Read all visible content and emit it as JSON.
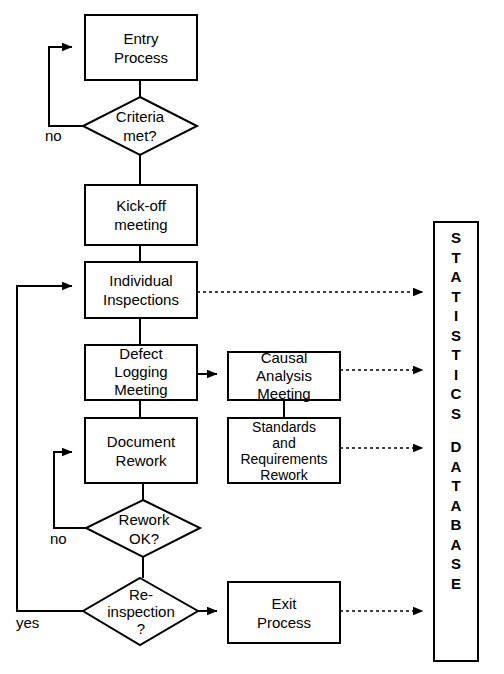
{
  "diagram": {
    "stroke_color": "#000000",
    "fill_color": "#ffffff",
    "nodes": [
      {
        "id": "entry",
        "shape": "process",
        "label": "Entry\nProcess",
        "x": 85,
        "y": 15,
        "w": 112,
        "h": 65
      },
      {
        "id": "criteria",
        "shape": "decision",
        "label": "Criteria\nmet?",
        "x": 83,
        "y": 97,
        "w": 114,
        "h": 58
      },
      {
        "id": "kickoff",
        "shape": "process",
        "label": "Kick-off\nmeeting",
        "x": 85,
        "y": 185,
        "w": 112,
        "h": 60
      },
      {
        "id": "individual",
        "shape": "process",
        "label": "Individual\nInspections",
        "x": 85,
        "y": 262,
        "w": 112,
        "h": 56
      },
      {
        "id": "defect",
        "shape": "process",
        "label": "Defect\nLogging\nMeeting",
        "x": 85,
        "y": 345,
        "w": 112,
        "h": 55
      },
      {
        "id": "causal",
        "shape": "process",
        "label": "Causal\nAnalysis\nMeeting",
        "x": 228,
        "y": 352,
        "w": 112,
        "h": 48
      },
      {
        "id": "document",
        "shape": "process",
        "label": "Document\nRework",
        "x": 85,
        "y": 418,
        "w": 112,
        "h": 65
      },
      {
        "id": "standards",
        "shape": "process",
        "label": "Standards\nand\nRequirements\nRework",
        "x": 228,
        "y": 418,
        "w": 112,
        "h": 65
      },
      {
        "id": "reworkok",
        "shape": "decision",
        "label": "Rework\nOK?",
        "x": 86,
        "y": 500,
        "w": 114,
        "h": 57
      },
      {
        "id": "reinspect",
        "shape": "decision",
        "label": "Re-\ninspection\n?",
        "x": 83,
        "y": 578,
        "w": 115,
        "h": 67
      },
      {
        "id": "exit",
        "shape": "process",
        "label": "Exit\nProcess",
        "x": 228,
        "y": 582,
        "w": 112,
        "h": 61
      },
      {
        "id": "database",
        "shape": "process",
        "label": "STATISTICS DATABASE",
        "x": 434,
        "y": 222,
        "w": 44,
        "h": 439
      }
    ],
    "database_letters_line1": [
      "S",
      "T",
      "A",
      "T",
      "I",
      "S",
      "T",
      "I",
      "C",
      "S"
    ],
    "database_letters_line2": [
      "D",
      "A",
      "T",
      "A",
      "B",
      "A",
      "S",
      "E"
    ],
    "edge_labels": [
      {
        "id": "criteria-no",
        "text": "no",
        "x": 45,
        "y": 128
      },
      {
        "id": "reworkok-no",
        "text": "no",
        "x": 50,
        "y": 532
      },
      {
        "id": "reinspect-yes",
        "text": "yes",
        "x": 16,
        "y": 617
      }
    ],
    "connections": [
      {
        "from": "entry",
        "to": "criteria",
        "style": "solid",
        "arrow": false
      },
      {
        "from": "criteria",
        "to": "entry",
        "style": "solid",
        "arrow": true,
        "label": "no"
      },
      {
        "from": "criteria",
        "to": "kickoff",
        "style": "solid",
        "arrow": false
      },
      {
        "from": "kickoff",
        "to": "individual",
        "style": "solid",
        "arrow": false
      },
      {
        "from": "individual",
        "to": "defect",
        "style": "solid",
        "arrow": false
      },
      {
        "from": "individual",
        "to": "database",
        "style": "dotted",
        "arrow": true
      },
      {
        "from": "defect",
        "to": "causal",
        "style": "solid",
        "arrow": true
      },
      {
        "from": "defect",
        "to": "document",
        "style": "solid",
        "arrow": false
      },
      {
        "from": "causal",
        "to": "database",
        "style": "dotted",
        "arrow": true
      },
      {
        "from": "causal",
        "to": "standards",
        "style": "solid",
        "arrow": false
      },
      {
        "from": "standards",
        "to": "database",
        "style": "dotted",
        "arrow": true
      },
      {
        "from": "document",
        "to": "reworkok",
        "style": "solid",
        "arrow": false
      },
      {
        "from": "reworkok",
        "to": "document",
        "style": "solid",
        "arrow": true,
        "label": "no"
      },
      {
        "from": "reworkok",
        "to": "reinspect",
        "style": "solid",
        "arrow": false
      },
      {
        "from": "reinspect",
        "to": "individual",
        "style": "solid",
        "arrow": true,
        "label": "yes"
      },
      {
        "from": "reinspect",
        "to": "exit",
        "style": "solid",
        "arrow": true
      },
      {
        "from": "exit",
        "to": "database",
        "style": "dotted",
        "arrow": true
      }
    ]
  }
}
